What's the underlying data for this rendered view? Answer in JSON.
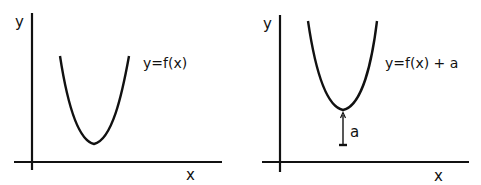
{
  "diagram": {
    "left": {
      "y_axis_label": "y",
      "x_axis_label": "x",
      "curve_label": "y=f(x)"
    },
    "right": {
      "y_axis_label": "y",
      "x_axis_label": "x",
      "curve_label": "y=f(x) + a",
      "shift_label": "a"
    },
    "colors": {
      "stroke": "#111111",
      "background": "#ffffff"
    }
  }
}
